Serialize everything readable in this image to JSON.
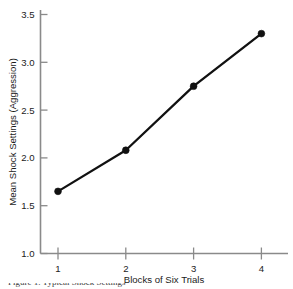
{
  "chart_data": {
    "type": "line",
    "title": "",
    "xlabel": "Blocks of Six Trials",
    "ylabel": "Mean Shock Settings (Aggression)",
    "x": [
      1,
      2,
      3,
      4
    ],
    "values": [
      1.65,
      2.08,
      2.75,
      3.3
    ],
    "xtick_labels": [
      "1",
      "2",
      "3",
      "4"
    ],
    "ytick_labels": [
      "1.0",
      "1.5",
      "2.0",
      "2.5",
      "3.0",
      "3.5"
    ],
    "ytick_values": [
      1.0,
      1.5,
      2.0,
      2.5,
      3.0,
      3.5
    ],
    "xlim": [
      0.72,
      4.3
    ],
    "ylim": [
      1.0,
      3.5
    ],
    "grid": false,
    "legend": false,
    "marker": "filled-circle",
    "line_color": "#111111",
    "axis_color": "#8a8a8a"
  },
  "figure": {
    "background": "#ffffff",
    "caption_partial": "Figure 1. Typical Shock Settings"
  }
}
